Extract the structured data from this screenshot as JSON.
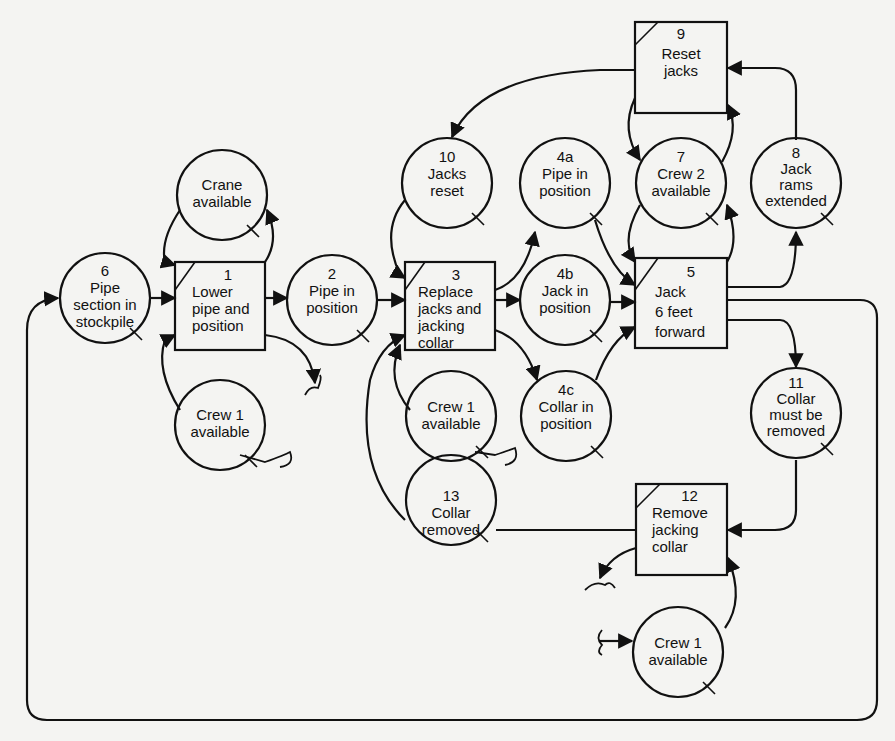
{
  "diagram": {
    "type": "process network (work-task boxes and queue circles)",
    "colors": {
      "background": "#f4f4f2",
      "stroke": "#111111"
    },
    "nodes": [
      {
        "id": "6",
        "kind": "queue",
        "number": "6",
        "lines": [
          "Pipe",
          "section in",
          "stockpile"
        ]
      },
      {
        "id": "crane",
        "kind": "queue",
        "number": "",
        "lines": [
          "Crane",
          "available"
        ]
      },
      {
        "id": "1",
        "kind": "task",
        "number": "1",
        "lines": [
          "Lower",
          "pipe and",
          "position"
        ]
      },
      {
        "id": "crew1a",
        "kind": "queue",
        "number": "",
        "lines": [
          "Crew 1",
          "available"
        ]
      },
      {
        "id": "2",
        "kind": "queue",
        "number": "2",
        "lines": [
          "Pipe in",
          "position"
        ]
      },
      {
        "id": "10",
        "kind": "queue",
        "number": "10",
        "lines": [
          "Jacks",
          "reset"
        ]
      },
      {
        "id": "3",
        "kind": "task",
        "number": "3",
        "lines": [
          "Replace",
          "jacks and",
          "jacking",
          "collar"
        ]
      },
      {
        "id": "crew1b",
        "kind": "queue",
        "number": "",
        "lines": [
          "Crew 1",
          "available"
        ]
      },
      {
        "id": "13",
        "kind": "queue",
        "number": "13",
        "lines": [
          "Collar",
          "removed"
        ]
      },
      {
        "id": "4a",
        "kind": "queue",
        "number": "4a",
        "lines": [
          "Pipe in",
          "position"
        ]
      },
      {
        "id": "4b",
        "kind": "queue",
        "number": "4b",
        "lines": [
          "Jack in",
          "position"
        ]
      },
      {
        "id": "4c",
        "kind": "queue",
        "number": "4c",
        "lines": [
          "Collar in",
          "position"
        ]
      },
      {
        "id": "9",
        "kind": "task",
        "number": "9",
        "lines": [
          "Reset",
          "jacks"
        ]
      },
      {
        "id": "7",
        "kind": "queue",
        "number": "7",
        "lines": [
          "Crew 2",
          "available"
        ]
      },
      {
        "id": "8",
        "kind": "queue",
        "number": "8",
        "lines": [
          "Jack",
          "rams",
          "extended"
        ]
      },
      {
        "id": "5",
        "kind": "task",
        "number": "5",
        "lines": [
          "Jack",
          "6 feet",
          "forward"
        ]
      },
      {
        "id": "11",
        "kind": "queue",
        "number": "11",
        "lines": [
          "Collar",
          "must be",
          "removed"
        ]
      },
      {
        "id": "12",
        "kind": "task",
        "number": "12",
        "lines": [
          "Remove",
          "jacking",
          "collar"
        ]
      },
      {
        "id": "crew1c",
        "kind": "queue",
        "number": "",
        "lines": [
          "Crew 1",
          "available"
        ]
      }
    ],
    "edges": [
      [
        "6",
        "1"
      ],
      [
        "crane",
        "1"
      ],
      [
        "1",
        "crane"
      ],
      [
        "crew1a",
        "1"
      ],
      [
        "1",
        "2"
      ],
      [
        "1",
        "break"
      ],
      [
        "2",
        "3"
      ],
      [
        "10",
        "3"
      ],
      [
        "crew1b",
        "3"
      ],
      [
        "13",
        "3"
      ],
      [
        "3",
        "4a"
      ],
      [
        "3",
        "4b"
      ],
      [
        "3",
        "4c"
      ],
      [
        "4a",
        "5"
      ],
      [
        "4b",
        "5"
      ],
      [
        "4c",
        "5"
      ],
      [
        "7",
        "5"
      ],
      [
        "5",
        "7"
      ],
      [
        "5",
        "8"
      ],
      [
        "5",
        "11"
      ],
      [
        "5",
        "6"
      ],
      [
        "8",
        "9"
      ],
      [
        "7",
        "9"
      ],
      [
        "9",
        "7"
      ],
      [
        "9",
        "10"
      ],
      [
        "11",
        "12"
      ],
      [
        "12",
        "13"
      ],
      [
        "12",
        "break"
      ],
      [
        "crew1c",
        "12"
      ],
      [
        "break",
        "crew1c"
      ]
    ]
  }
}
